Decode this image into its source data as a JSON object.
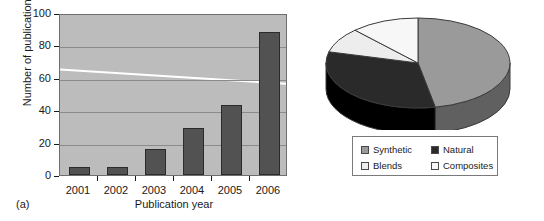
{
  "figure": {
    "panel_a_tag": "(a)",
    "panel_b_tag": "(b)"
  },
  "colors": {
    "plot_background": "#bcbcbc",
    "gridline": "#8b8b8b",
    "bar_fill": "#525252",
    "bar_stroke": "#2b2b2b",
    "trend_line": "#ffffff",
    "axis_text": "#1a1a1a",
    "synthetic": "#9a9a9a",
    "natural": "#2a2a2a",
    "blends": "#ededed",
    "composites": "#f7f7f7",
    "pie_outline": "#3a3a3a"
  },
  "chart_data": [
    {
      "type": "bar",
      "title": "",
      "xlabel": "Publication year",
      "ylabel": "Number of publications",
      "categories": [
        "2001",
        "2002",
        "2003",
        "2004",
        "2005",
        "2006"
      ],
      "values": [
        5,
        5,
        16,
        29,
        43,
        88
      ],
      "ylim": [
        0,
        100
      ],
      "yticks": [
        0,
        20,
        40,
        60,
        80,
        100
      ],
      "ytick_labels": [
        "0",
        "20",
        "40",
        "60",
        "80",
        "100"
      ],
      "grid": true,
      "legend": "none",
      "series": [
        {
          "name": "Number of publications",
          "values": [
            5,
            5,
            16,
            29,
            43,
            88
          ]
        },
        {
          "name": "trend-line",
          "type": "line",
          "color": "#ffffff",
          "x": [
            "2001",
            "2006"
          ],
          "values": [
            66,
            57
          ]
        }
      ]
    },
    {
      "type": "pie",
      "title": "",
      "three_d": true,
      "labels": [
        "Synthetic",
        "Natural",
        "Blends",
        "Composites"
      ],
      "values": [
        47,
        32,
        9,
        12
      ],
      "colors": [
        "#9a9a9a",
        "#2a2a2a",
        "#ededed",
        "#f7f7f7"
      ],
      "legend": {
        "position": "bottom",
        "entries": [
          {
            "label": "Synthetic",
            "color": "#9a9a9a"
          },
          {
            "label": "Natural",
            "color": "#2a2a2a"
          },
          {
            "label": "Blends",
            "color": "#ededed"
          },
          {
            "label": "Composites",
            "color": "#f7f7f7"
          }
        ]
      }
    }
  ]
}
